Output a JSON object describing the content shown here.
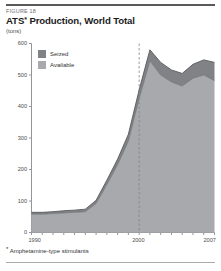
{
  "figure": {
    "number_label": "FIGURE 18",
    "title_main": "ATS",
    "title_asterisk": "*",
    "title_rest": " Production, World Total",
    "unit_label": "(tons)",
    "footnote_marker": "*",
    "footnote_text": " Amphetamine-type stimulants"
  },
  "colors": {
    "seized": "#808285",
    "available": "#a7a9ac",
    "outline": "#58595b",
    "axis": "#939598",
    "text": "#333333",
    "reference_line": "#808285",
    "background": "#ffffff"
  },
  "chart_data": {
    "type": "area",
    "stacked": true,
    "title": "ATS* Production, World Total",
    "subtitle": "FIGURE 18",
    "xlabel": "",
    "ylabel": "(tons)",
    "ylim": [
      0,
      600
    ],
    "xlim": [
      1990,
      2007
    ],
    "ytick_values": [
      0,
      100,
      200,
      300,
      400,
      500,
      600
    ],
    "ytick_labels": [
      "0",
      "100",
      "200",
      "300",
      "400",
      "500",
      "600"
    ],
    "xtick_values": [
      1990,
      1991,
      1992,
      1993,
      1994,
      1995,
      1996,
      1997,
      1998,
      1999,
      2000,
      2001,
      2002,
      2003,
      2004,
      2005,
      2006,
      2007
    ],
    "xtick_labeled": [
      1990,
      2000,
      2007
    ],
    "xtick_labels": [
      "1990",
      "2000",
      "2007"
    ],
    "grid": false,
    "legend_position": "top-left",
    "x": [
      1990,
      1991,
      1992,
      1993,
      1994,
      1995,
      1996,
      1997,
      1998,
      1999,
      2000,
      2001,
      2002,
      2003,
      2004,
      2005,
      2006,
      2007
    ],
    "series": [
      {
        "name": "Available",
        "color": "#a7a9ac",
        "values": [
          58,
          58,
          60,
          62,
          64,
          66,
          92,
          152,
          215,
          290,
          425,
          545,
          500,
          478,
          465,
          490,
          500,
          482
        ]
      },
      {
        "name": "Seized",
        "color": "#808285",
        "values": [
          6,
          6,
          6,
          7,
          7,
          8,
          10,
          14,
          18,
          22,
          28,
          35,
          40,
          38,
          40,
          44,
          48,
          58
        ]
      }
    ],
    "totals": [
      64,
      64,
      66,
      69,
      71,
      74,
      102,
      166,
      233,
      312,
      453,
      580,
      540,
      516,
      505,
      534,
      548,
      540
    ],
    "annotations": [
      {
        "type": "vertical-dashed-line",
        "x": 2000,
        "label": ""
      }
    ]
  },
  "legend": {
    "items": [
      {
        "label": "Seized",
        "key": "seized"
      },
      {
        "label": "Available",
        "key": "available"
      }
    ]
  }
}
